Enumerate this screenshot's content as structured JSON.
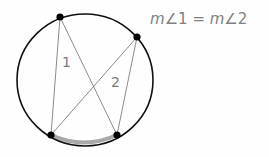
{
  "diagram": {
    "equation": {
      "m1": "m",
      "angle1": "∠1",
      "equals": " = ",
      "m2": "m",
      "angle2": "∠2"
    },
    "labels": {
      "angle1": "1",
      "angle2": "2"
    },
    "circle": {
      "cx": 85,
      "cy": 80,
      "rx": 68,
      "ry": 66,
      "stroke": "#111111"
    },
    "points": [
      {
        "name": "top",
        "x": 60,
        "y": 17
      },
      {
        "name": "right",
        "x": 137,
        "y": 37
      },
      {
        "name": "bottom-left",
        "x": 51,
        "y": 135
      },
      {
        "name": "bottom-right",
        "x": 117,
        "y": 135
      }
    ],
    "colors": {
      "chord": "#8c8c8c",
      "arc_highlight": "#9a9a9a",
      "text": "#808080"
    }
  }
}
